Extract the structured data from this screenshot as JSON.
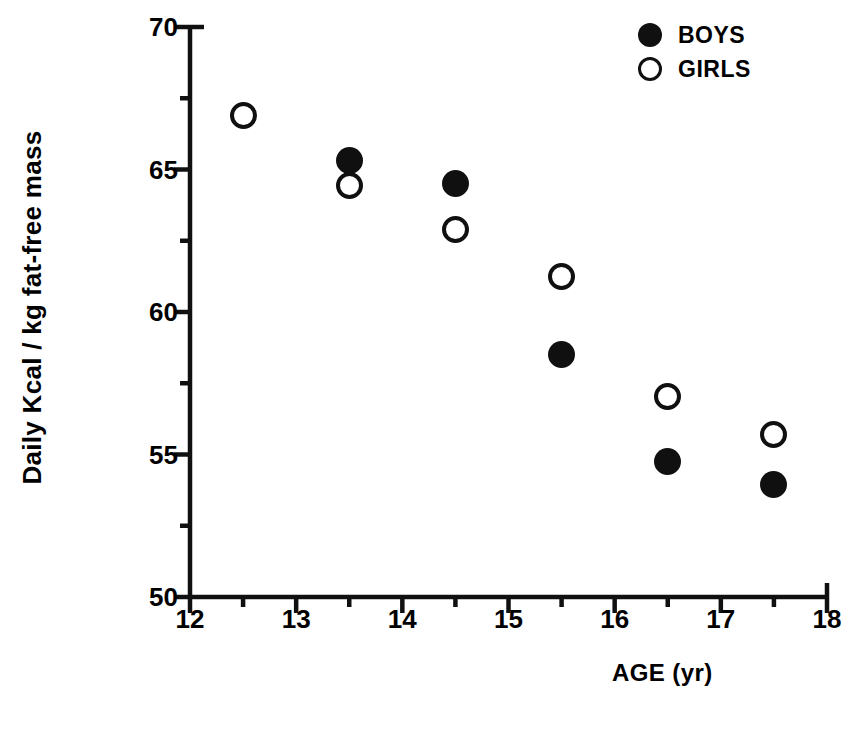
{
  "chart_data": {
    "type": "scatter",
    "title": "",
    "xlabel": "AGE (yr)",
    "ylabel": "Daily Kcal / kg fat-free mass",
    "xlim": [
      12,
      18
    ],
    "ylim": [
      50,
      70
    ],
    "xticks": [
      12,
      13,
      14,
      15,
      16,
      17,
      18
    ],
    "xtick_labels": [
      "12",
      "13",
      "14",
      "15",
      "16",
      "17",
      "18"
    ],
    "xminor_ticks": [
      12.5,
      13.5,
      14.5,
      15.5,
      16.5,
      17.5
    ],
    "yticks": [
      50,
      55,
      60,
      65,
      70
    ],
    "ytick_labels": [
      "50",
      "55",
      "60",
      "65",
      "70"
    ],
    "yminor_ticks": [
      52.5,
      57.5,
      62.5,
      67.5
    ],
    "grid": false,
    "legend_position": "top-right",
    "series": [
      {
        "name": "BOYS",
        "marker": "filled-circle",
        "color": "#101010",
        "points": [
          {
            "x": 13.5,
            "y": 65.3
          },
          {
            "x": 14.5,
            "y": 64.5
          },
          {
            "x": 15.5,
            "y": 58.5
          },
          {
            "x": 16.5,
            "y": 54.75
          },
          {
            "x": 17.5,
            "y": 53.95
          }
        ]
      },
      {
        "name": "GIRLS",
        "marker": "open-circle",
        "color": "#101010",
        "points": [
          {
            "x": 12.5,
            "y": 66.9
          },
          {
            "x": 13.5,
            "y": 64.45
          },
          {
            "x": 14.5,
            "y": 62.9
          },
          {
            "x": 15.5,
            "y": 61.25
          },
          {
            "x": 16.5,
            "y": 57.05
          },
          {
            "x": 17.5,
            "y": 55.7
          }
        ]
      }
    ]
  },
  "legend": {
    "entries": [
      {
        "label": "BOYS",
        "marker": "filled-circle"
      },
      {
        "label": "GIRLS",
        "marker": "open-circle"
      }
    ]
  },
  "axes": {
    "x_title": "AGE (yr)",
    "y_title": "Daily Kcal / kg fat-free mass"
  },
  "caption": {
    "text": ""
  },
  "colors": {
    "ink": "#101010",
    "background": "#ffffff"
  }
}
